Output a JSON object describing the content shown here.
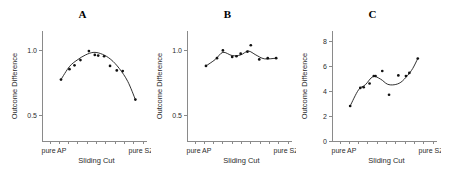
{
  "figure": {
    "width": 453,
    "height": 180,
    "background": "#ffffff",
    "line_color": "#1a1a1a",
    "point_color": "#111111",
    "axis_color": "#8a8a8a"
  },
  "panels": [
    {
      "title": "A",
      "xlabel": "Sliding Cut",
      "ylabel": "Outcome Difference",
      "xticklabels": [
        "pure AP",
        "pure SZ"
      ],
      "yticklabels": [
        "0.5",
        "1.0"
      ]
    },
    {
      "title": "B",
      "xlabel": "Sliding Cut",
      "ylabel": "Outcome Difference",
      "xticklabels": [
        "pure AP",
        "pure SZ"
      ],
      "yticklabels": [
        "0.5",
        "1.0"
      ]
    },
    {
      "title": "C",
      "xlabel": "Sliding Cut",
      "ylabel": "Outcome Difference",
      "xticklabels": [
        "pure AP",
        "pure SZ"
      ],
      "yticklabels": [
        "0",
        "2",
        "4",
        "6",
        "8"
      ]
    }
  ],
  "chart_data": [
    {
      "type": "scatter",
      "title": "A",
      "xlabel": "Sliding Cut",
      "ylabel": "Outcome Difference",
      "xlim": [
        0,
        11
      ],
      "ylim": [
        0.3,
        1.15
      ],
      "yticks": [
        0.5,
        1.0
      ],
      "ytick_labels": [
        "0.5",
        "1.0"
      ],
      "xtick_labels": [
        "pure AP",
        "pure SZ"
      ],
      "grid": false,
      "legend": "none",
      "x": [
        1.3,
        2.3,
        2.9,
        3.6,
        4.6,
        5.3,
        5.7,
        6.4,
        7.1,
        7.9,
        8.6,
        10.1
      ],
      "y": [
        0.775,
        0.855,
        0.885,
        0.925,
        0.995,
        0.965,
        0.96,
        0.955,
        0.88,
        0.845,
        0.84,
        0.62
      ],
      "fit_line": {
        "name": "loess smooth",
        "x": [
          1.3,
          2.3,
          3.2,
          4.2,
          5.2,
          6.2,
          7.2,
          8.2,
          9.2,
          10.1
        ],
        "y": [
          0.775,
          0.875,
          0.925,
          0.965,
          0.985,
          0.97,
          0.93,
          0.86,
          0.76,
          0.62
        ]
      }
    },
    {
      "type": "scatter",
      "title": "B",
      "xlabel": "Sliding Cut",
      "ylabel": "Outcome Difference",
      "xlim": [
        0,
        11
      ],
      "ylim": [
        0.3,
        1.15
      ],
      "yticks": [
        0.5,
        1.0
      ],
      "ytick_labels": [
        "0.5",
        "1.0"
      ],
      "xtick_labels": [
        "pure AP",
        "pure SZ"
      ],
      "grid": false,
      "legend": "none",
      "x": [
        1.3,
        2.6,
        3.3,
        4.4,
        4.9,
        5.4,
        6.2,
        6.6,
        7.6,
        8.6,
        9.6
      ],
      "y": [
        0.88,
        0.94,
        1.0,
        0.95,
        0.955,
        0.975,
        0.99,
        1.04,
        0.93,
        0.94,
        0.94
      ],
      "fit_line": {
        "name": "loess smooth",
        "x": [
          1.3,
          2.4,
          3.3,
          4.4,
          5.4,
          6.3,
          7.2,
          8.2,
          9.6
        ],
        "y": [
          0.88,
          0.93,
          0.985,
          0.96,
          0.965,
          0.995,
          0.965,
          0.935,
          0.94
        ]
      }
    },
    {
      "type": "scatter",
      "title": "C",
      "xlabel": "Sliding Cut",
      "ylabel": "Outcome Difference",
      "xlim": [
        0,
        11
      ],
      "ylim": [
        0,
        8.8
      ],
      "yticks": [
        0,
        2,
        4,
        6,
        8
      ],
      "ytick_labels": [
        "0",
        "2",
        "4",
        "6",
        "8"
      ],
      "xtick_labels": [
        "pure AP",
        "pure SZ"
      ],
      "grid": false,
      "legend": "none",
      "x": [
        1.2,
        2.4,
        2.8,
        3.5,
        4.0,
        4.2,
        5.0,
        5.8,
        6.9,
        7.8,
        8.2,
        9.2
      ],
      "y": [
        2.8,
        4.25,
        4.3,
        4.6,
        5.2,
        5.2,
        5.6,
        3.7,
        5.25,
        5.2,
        5.45,
        6.6
      ],
      "fit_line": {
        "name": "loess smooth",
        "x": [
          1.2,
          2.2,
          3.0,
          3.9,
          4.8,
          5.6,
          6.4,
          7.2,
          8.0,
          8.6,
          9.2
        ],
        "y": [
          2.8,
          4.1,
          4.5,
          5.15,
          4.95,
          4.55,
          4.5,
          4.7,
          5.25,
          5.8,
          6.6
        ]
      }
    }
  ]
}
